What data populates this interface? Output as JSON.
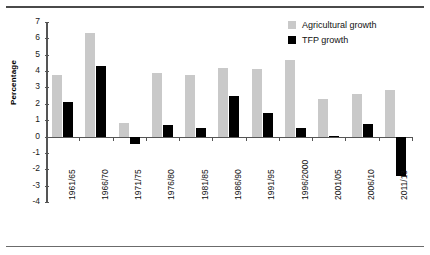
{
  "chart_data": {
    "type": "bar",
    "title": "",
    "subtitle": "",
    "xlabel": "",
    "ylabel": "Percentage",
    "ylim": [
      -4,
      7
    ],
    "ytick_step": 1,
    "yticks": [
      7,
      6,
      5,
      4,
      3,
      2,
      1,
      0,
      -1,
      -2,
      -3,
      -4
    ],
    "ytick_labels": [
      "7",
      "6",
      "5",
      "4",
      "3",
      "2",
      "1",
      "0",
      "-1",
      "-2",
      "-3",
      "-4"
    ],
    "grid": false,
    "legend_position": "top-right",
    "categories": [
      "1961/65",
      "1966/70",
      "1971/75",
      "1976/80",
      "1981/85",
      "1986/90",
      "1991/95",
      "1996/2000",
      "2001/05",
      "2006/10",
      "2011/13"
    ],
    "series": [
      {
        "name": "Agricultural growth",
        "color": "#c9c9c9",
        "values": [
          3.75,
          6.35,
          0.85,
          3.9,
          3.75,
          4.2,
          4.1,
          4.65,
          2.3,
          2.6,
          2.85
        ]
      },
      {
        "name": "TFP growth",
        "color": "#000000",
        "values": [
          2.1,
          4.3,
          -0.45,
          0.7,
          0.5,
          2.5,
          1.45,
          0.55,
          0.05,
          0.75,
          -2.4
        ]
      }
    ]
  },
  "legend": {
    "items": [
      {
        "label": "Agricultural growth",
        "swatch": "gray-square-swatch"
      },
      {
        "label": "TFP growth",
        "swatch": "black-square-swatch"
      }
    ]
  },
  "axes": {
    "y_title": "Percentage"
  }
}
